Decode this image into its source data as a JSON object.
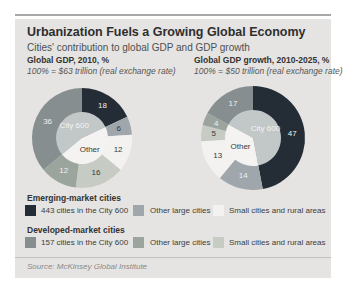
{
  "panel": {
    "title": "Urbanization Fuels a Growing Global Economy",
    "subtitle": "Cities' contribution to global GDP and GDP growth",
    "source": "Source: McKinsey Global Institute",
    "background": "#e5e4e2"
  },
  "colors": {
    "emerging-city600": "#242d36",
    "emerging-other": "#9fa6ac",
    "emerging-small": "#f3f2f0",
    "developed-city600": "#878e90",
    "developed-other": "#9ca59d",
    "developed-small": "#c6cbc3",
    "inner-city600": "#c2c7c7",
    "inner-other": "#f4f3f1",
    "label-light": "#efefed",
    "label-dark": "#3a3a3a"
  },
  "chart_data": [
    {
      "type": "donut",
      "title": "Global GDP, 2010, %",
      "subtitle": "100% = $63 trillion (real exchange rate)",
      "center_labels": {
        "city600": "City 600",
        "other": "Other"
      },
      "city600_total_pct": 54,
      "other_total_pct": 46,
      "slices": [
        {
          "value": 18,
          "category": "emerging-city600",
          "label_tone": "light"
        },
        {
          "value": 6,
          "category": "emerging-other",
          "label_tone": "dark"
        },
        {
          "value": 12,
          "category": "emerging-small",
          "label_tone": "dark"
        },
        {
          "value": 16,
          "category": "developed-small",
          "label_tone": "dark"
        },
        {
          "value": 12,
          "category": "developed-other",
          "label_tone": "light"
        },
        {
          "value": 36,
          "category": "developed-city600",
          "label_tone": "light"
        }
      ]
    },
    {
      "type": "donut",
      "title": "Global GDP growth, 2010-2025, %",
      "subtitle": "100% = $50 trillion (real exchange rate)",
      "center_labels": {
        "city600": "City 600",
        "other": "Other"
      },
      "city600_total_pct": 64,
      "other_total_pct": 36,
      "slices": [
        {
          "value": 47,
          "category": "emerging-city600",
          "label_tone": "light"
        },
        {
          "value": 14,
          "category": "emerging-other",
          "label_tone": "light"
        },
        {
          "value": 13,
          "category": "emerging-small",
          "label_tone": "dark"
        },
        {
          "value": 5,
          "category": "developed-small",
          "label_tone": "dark"
        },
        {
          "value": 4,
          "category": "developed-other",
          "label_tone": "light"
        },
        {
          "value": 17,
          "category": "developed-city600",
          "label_tone": "light"
        }
      ]
    }
  ],
  "legend": {
    "groups": [
      {
        "title": "Emerging-market cities",
        "items": [
          {
            "label": "443 cities in the City 600",
            "category": "emerging-city600"
          },
          {
            "label": "Other large cities",
            "category": "emerging-other"
          },
          {
            "label": "Small cities and rural areas",
            "category": "emerging-small"
          }
        ]
      },
      {
        "title": "Developed-market cities",
        "items": [
          {
            "label": "157 cities in the City 600",
            "category": "developed-city600"
          },
          {
            "label": "Other large cities",
            "category": "developed-other"
          },
          {
            "label": "Small cities and rural areas",
            "category": "developed-small"
          }
        ]
      }
    ]
  }
}
